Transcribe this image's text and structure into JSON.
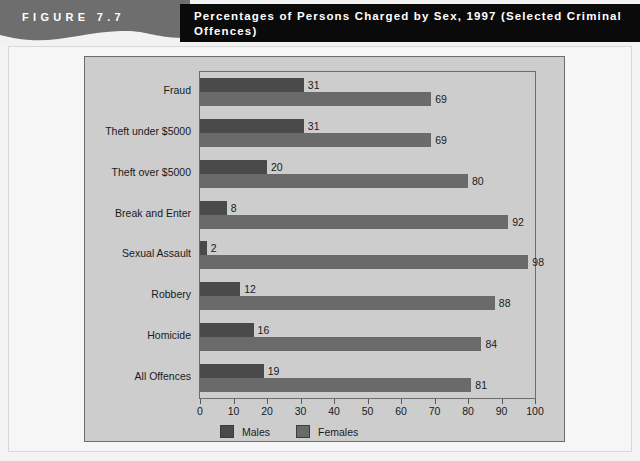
{
  "figure": {
    "label": "FIGURE 7.7",
    "title": "Percentages of Persons Charged by Sex, 1997 (Selected Criminal Offences)"
  },
  "colors": {
    "band": "#6e6e6e",
    "title_bar": "#0a0a0a",
    "panel": "#cdcdcd",
    "males": "#4a4a4a",
    "females": "#6a6a6a",
    "axis": "#5a5a5a"
  },
  "chart_data": {
    "type": "bar",
    "orientation": "horizontal",
    "title": "Percentages of Persons Charged by Sex, 1997 (Selected Criminal Offences)",
    "xlabel": "",
    "ylabel": "",
    "xlim": [
      0,
      100
    ],
    "xticks": [
      0,
      10,
      20,
      30,
      40,
      50,
      60,
      70,
      80,
      90,
      100
    ],
    "grid": false,
    "legend_position": "bottom-left",
    "categories": [
      "Fraud",
      "Theft under $5000",
      "Theft over $5000",
      "Break and Enter",
      "Sexual Assault",
      "Robbery",
      "Homicide",
      "All Offences"
    ],
    "series": [
      {
        "name": "Males",
        "values": [
          31,
          31,
          20,
          8,
          2,
          12,
          16,
          19
        ]
      },
      {
        "name": "Females",
        "values": [
          69,
          69,
          80,
          92,
          98,
          88,
          84,
          81
        ]
      }
    ]
  },
  "legend": {
    "items": [
      {
        "label": "Males"
      },
      {
        "label": "Females"
      }
    ]
  }
}
